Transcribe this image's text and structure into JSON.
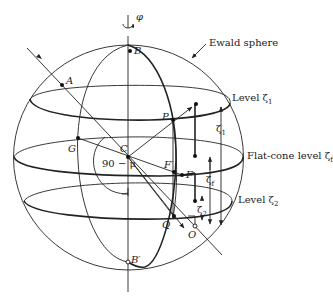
{
  "figure": {
    "colors": {
      "ink": "#222222",
      "background": "#ffffff"
    },
    "labels": {
      "sphere": "Ewald sphere",
      "rotation": "φ",
      "level1": "Level ζ",
      "level1_sub": "1",
      "flatcone": "Flat-cone level ζ",
      "flatcone_sub": "f",
      "level2": "Level ζ",
      "level2_sub": "2",
      "angle": "90 − μ",
      "zeta1": "ζ",
      "zeta1_sub": "1",
      "zetaf": "ζ",
      "zetaf_sub": "f",
      "zeta2": "ζ",
      "zeta2_sub": "2"
    },
    "points": {
      "A": "A",
      "B": "B",
      "Bprime": "B′",
      "C": "C",
      "G": "G",
      "P": "P",
      "F": "F",
      "Fprime": "F′",
      "Q": "Q",
      "O": "O"
    }
  }
}
